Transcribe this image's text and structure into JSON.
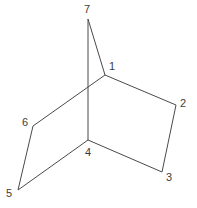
{
  "figure": {
    "width": 197,
    "height": 208,
    "background_color": "#ffffff",
    "line_color": "#4a4a4a",
    "label_color": "#3d3d3d",
    "line_width": 1
  },
  "atoms": [
    {
      "id": "1",
      "label": "1",
      "x": 105,
      "y": 75,
      "label_x": 109,
      "label_y": 61
    },
    {
      "id": "2",
      "label": "2",
      "x": 176,
      "y": 105,
      "label_x": 180,
      "label_y": 98
    },
    {
      "id": "3",
      "label": "3",
      "x": 162,
      "y": 172,
      "label_x": 166,
      "label_y": 172
    },
    {
      "id": "4",
      "label": "4",
      "x": 88,
      "y": 140,
      "label_x": 85,
      "label_y": 147
    },
    {
      "id": "5",
      "label": "5",
      "x": 18,
      "y": 190,
      "label_x": 6,
      "label_y": 188
    },
    {
      "id": "6",
      "label": "6",
      "x": 33,
      "y": 126,
      "label_x": 22,
      "label_y": 117
    },
    {
      "id": "7",
      "label": "7",
      "x": 88,
      "y": 19,
      "label_x": 84,
      "label_y": 4
    }
  ],
  "bonds": [
    {
      "name": "bond-7-1",
      "from": "7",
      "to": "1",
      "x1": 88,
      "y1": 19,
      "x2": 105,
      "y2": 75
    },
    {
      "name": "bond-7-4",
      "from": "7",
      "to": "4",
      "x1": 88,
      "y1": 19,
      "x2": 88,
      "y2": 140
    },
    {
      "name": "bond-1-2",
      "from": "1",
      "to": "2",
      "x1": 105,
      "y1": 75,
      "x2": 176,
      "y2": 105
    },
    {
      "name": "bond-2-3",
      "from": "2",
      "to": "3",
      "x1": 176,
      "y1": 105,
      "x2": 162,
      "y2": 172
    },
    {
      "name": "bond-3-4",
      "from": "3",
      "to": "4",
      "x1": 162,
      "y1": 172,
      "x2": 88,
      "y2": 140
    },
    {
      "name": "bond-1-6",
      "from": "1",
      "to": "6",
      "x1": 105,
      "y1": 75,
      "x2": 33,
      "y2": 126
    },
    {
      "name": "bond-6-5",
      "from": "6",
      "to": "5",
      "x1": 33,
      "y1": 126,
      "x2": 18,
      "y2": 190
    },
    {
      "name": "bond-5-4",
      "from": "5",
      "to": "4",
      "x1": 18,
      "y1": 190,
      "x2": 88,
      "y2": 140
    }
  ]
}
